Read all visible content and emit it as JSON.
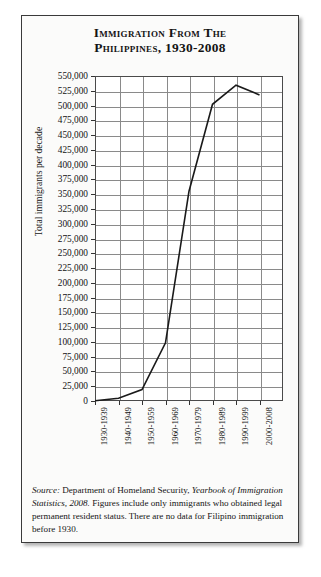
{
  "figure": {
    "title_line1": "Immigration from the",
    "title_line2": "Philippines, 1930-2008"
  },
  "source_note": {
    "lead": "Source:",
    "text_before_work": " Department of Homeland Security, ",
    "work": "Yearbook of Immigration Statistics, 2008.",
    "text_after_work": " Figures include only immigrants who obtained legal permanent resident status. There are no data for Filipino immigration before 1930."
  },
  "colors": {
    "line": "#1a1a1a",
    "grid": "#8a8a8a",
    "frame": "#3a3a3a",
    "background": "#fbfbfa",
    "plot_background": "#ffffff",
    "text": "#141414"
  },
  "chart_data": {
    "type": "line",
    "title": "Immigration from the Philippines, 1930-2008",
    "xlabel": "",
    "ylabel": "Total immigrants per decade",
    "categories": [
      "1930-1939",
      "1940-1949",
      "1950-1959",
      "1960-1969",
      "1970-1979",
      "1980-1989",
      "1990-1999",
      "2000-2008"
    ],
    "values": [
      528,
      4691,
      19307,
      98376,
      354987,
      502056,
      534338,
      518000
    ],
    "ylim": [
      0,
      550000
    ],
    "ytick_step": 25000,
    "ytick_labels": [
      "550,000",
      "525,000",
      "500,000",
      "475,000",
      "450,000",
      "425,000",
      "400,000",
      "375,000",
      "350,000",
      "325,000",
      "300,000",
      "275,000",
      "250,000",
      "225,000",
      "200,000",
      "175,000",
      "150,000",
      "125,000",
      "100,000",
      "75,000",
      "50,000",
      "25,000",
      "0"
    ],
    "grid": true,
    "legend": false,
    "series": [
      {
        "name": "Total immigrants per decade",
        "values": [
          528,
          4691,
          19307,
          98376,
          354987,
          502056,
          534338,
          518000
        ]
      }
    ]
  }
}
